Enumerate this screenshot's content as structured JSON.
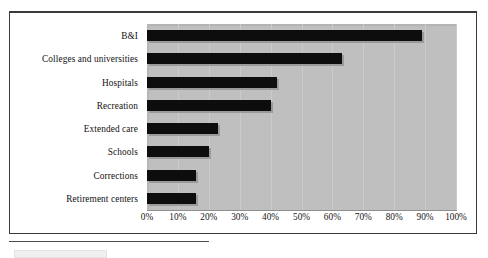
{
  "chart_data": {
    "type": "bar",
    "orientation": "horizontal",
    "title": "",
    "xlabel": "",
    "ylabel": "",
    "categories": [
      "B&I",
      "Colleges and universities",
      "Hospitals",
      "Recreation",
      "Extended care",
      "Schools",
      "Corrections",
      "Retirement centers"
    ],
    "values": [
      89,
      63,
      42,
      40,
      23,
      20,
      16,
      16
    ],
    "value_unit": "%",
    "xlim": [
      0,
      100
    ],
    "xticks": [
      0,
      10,
      20,
      30,
      40,
      50,
      60,
      70,
      80,
      90,
      100
    ],
    "xtick_labels": [
      "0%",
      "10%",
      "20%",
      "30%",
      "40%",
      "50%",
      "60%",
      "70%",
      "80%",
      "90%",
      "100%"
    ],
    "grid": "vertical",
    "legend": "none",
    "series": [
      {
        "name": "",
        "values": [
          89,
          63,
          42,
          40,
          23,
          20,
          16,
          16
        ]
      }
    ]
  },
  "style": {
    "plot_background": "#bfbfbf",
    "bar_color": "#0d0d0d",
    "gridline_color": "#cbcbcb",
    "axis_color": "#8f8f8f",
    "frame_color": "#3a3a3a",
    "text_color": "#121212",
    "page_background": "#ffffff"
  }
}
